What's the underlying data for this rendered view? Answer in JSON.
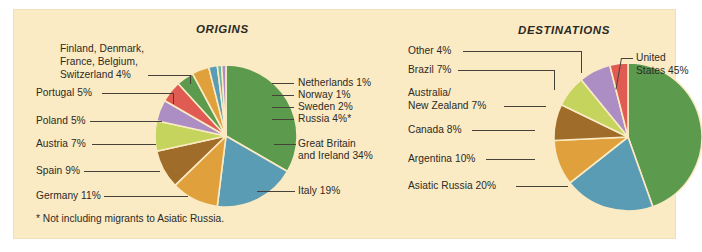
{
  "figure": {
    "background_color": "#fbebc4",
    "text_color": "#2b2a26",
    "footnote": "* Not including migrants to Asiatic Russia."
  },
  "panels": {
    "origins": {
      "title": "ORIGINS"
    },
    "destinations": {
      "title": "DESTINATIONS"
    }
  },
  "labels": {
    "origins": {
      "group_nordic_line1": "Finland, Denmark,",
      "group_nordic_line2": "France, Belgium,",
      "group_nordic_line3": "Switzerland  4%",
      "portugal": "Portugal  5%",
      "poland": "Poland  5%",
      "austria": "Austria  7%",
      "spain": "Spain  9%",
      "germany": "Germany  11%",
      "netherlands": "Netherlands 1%",
      "norway": "Norway 1%",
      "sweden": "Sweden 2%",
      "russia": "Russia 4%*",
      "britain_line1": "Great Britain",
      "britain_line2": "and Ireland 34%",
      "italy": "Italy 19%"
    },
    "destinations": {
      "other": "Other  4%",
      "brazil": "Brazil  7%",
      "anz_line1": "Australia/",
      "anz_line2": "New Zealand  7%",
      "canada": "Canada  8%",
      "argentina": "Argentina  10%",
      "asiatic_russia": "Asiatic Russia  20%",
      "us_line1": "United",
      "us_line2": "States 45%"
    }
  },
  "chart_data": [
    {
      "type": "pie",
      "id": "origins",
      "title": "ORIGINS",
      "footnote": "* Not including migrants to Asiatic Russia.",
      "start_angle_deg": 0,
      "direction": "clockwise",
      "total": 102,
      "slices": [
        {
          "label": "Great Britain and Ireland",
          "value": 34,
          "display": "Great Britain and Ireland 34%",
          "color": "#5c9a4e"
        },
        {
          "label": "Italy",
          "value": 19,
          "display": "Italy 19%",
          "color": "#5b9cb5"
        },
        {
          "label": "Germany",
          "value": 11,
          "display": "Germany  11%",
          "color": "#e0a03c"
        },
        {
          "label": "Spain",
          "value": 9,
          "display": "Spain  9%",
          "color": "#a06c2a"
        },
        {
          "label": "Austria",
          "value": 7,
          "display": "Austria  7%",
          "color": "#c5d45c"
        },
        {
          "label": "Poland",
          "value": 5,
          "display": "Poland  5%",
          "color": "#ac8ec4"
        },
        {
          "label": "Portugal",
          "value": 5,
          "display": "Portugal  5%",
          "color": "#e05b52"
        },
        {
          "label": "Finland, Denmark, France, Belgium, Switzerland",
          "value": 4,
          "display": "Finland, Denmark, France, Belgium, Switzerland  4%",
          "color": "#5c9a4e"
        },
        {
          "label": "Russia",
          "value": 4,
          "display": "Russia 4%*",
          "color": "#e0a03c"
        },
        {
          "label": "Sweden",
          "value": 2,
          "display": "Sweden 2%",
          "color": "#5b9cb5"
        },
        {
          "label": "Norway",
          "value": 1,
          "display": "Norway 1%",
          "color": "#6ab3a5"
        },
        {
          "label": "Netherlands",
          "value": 1,
          "display": "Netherlands 1%",
          "color": "#ac8ec4"
        }
      ]
    },
    {
      "type": "pie",
      "id": "destinations",
      "title": "DESTINATIONS",
      "start_angle_deg": 0,
      "direction": "clockwise",
      "total": 101,
      "slices": [
        {
          "label": "United States",
          "value": 45,
          "display": "United States 45%",
          "color": "#5c9a4e"
        },
        {
          "label": "Asiatic Russia",
          "value": 20,
          "display": "Asiatic Russia  20%",
          "color": "#5b9cb5"
        },
        {
          "label": "Argentina",
          "value": 10,
          "display": "Argentina  10%",
          "color": "#e0a03c"
        },
        {
          "label": "Canada",
          "value": 8,
          "display": "Canada  8%",
          "color": "#a06c2a"
        },
        {
          "label": "Australia/New Zealand",
          "value": 7,
          "display": "Australia/ New Zealand  7%",
          "color": "#c5d45c"
        },
        {
          "label": "Brazil",
          "value": 7,
          "display": "Brazil  7%",
          "color": "#ac8ec4"
        },
        {
          "label": "Other",
          "value": 4,
          "display": "Other  4%",
          "color": "#e05b52"
        }
      ]
    }
  ]
}
